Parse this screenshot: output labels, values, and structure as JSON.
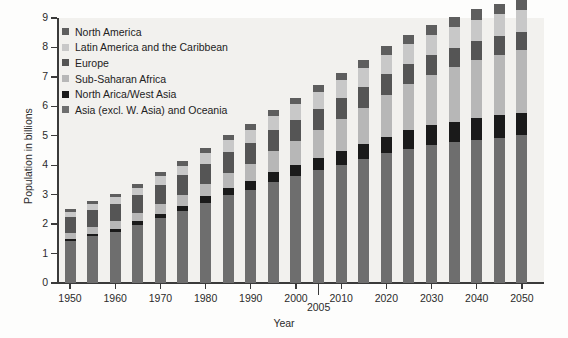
{
  "chart_data": {
    "type": "bar",
    "stacked": true,
    "title": "",
    "xlabel": "Year",
    "ylabel": "Population in billions",
    "ylim": [
      0,
      9
    ],
    "ytick_values": [
      0,
      1,
      2,
      3,
      4,
      5,
      6,
      7,
      8,
      9
    ],
    "ytick_labels": [
      "0",
      "1",
      "2",
      "3",
      "4",
      "5",
      "6",
      "7",
      "8",
      "9"
    ],
    "grid": false,
    "legend_position": "top-left inside plot",
    "categories": [
      "1950",
      "1955",
      "1960",
      "1965",
      "1970",
      "1975",
      "1980",
      "1985",
      "1990",
      "1995",
      "2000",
      "2005",
      "2010",
      "2015",
      "2020",
      "2025",
      "2030",
      "2035",
      "2040",
      "2045",
      "2050"
    ],
    "xtick_labels": [
      "1950",
      "1960",
      "1970",
      "1980",
      "1990",
      "2000",
      "2010",
      "2020",
      "2030",
      "2040",
      "2050"
    ],
    "annotation_tick_label": "2005",
    "series": [
      {
        "name": "Asia (excl. W. Asia) and Oceania",
        "color": "#6e6e6e",
        "values": [
          1.42,
          1.58,
          1.74,
          1.96,
          2.2,
          2.43,
          2.72,
          2.99,
          3.15,
          3.43,
          3.64,
          3.84,
          4.02,
          4.2,
          4.4,
          4.56,
          4.68,
          4.78,
          4.86,
          4.94,
          5.02
        ]
      },
      {
        "name": "North Arica/West Asia",
        "color": "#1a1a1a",
        "values": [
          0.09,
          0.1,
          0.11,
          0.13,
          0.16,
          0.19,
          0.22,
          0.25,
          0.3,
          0.34,
          0.38,
          0.42,
          0.47,
          0.52,
          0.57,
          0.62,
          0.67,
          0.7,
          0.73,
          0.75,
          0.77
        ]
      },
      {
        "name": "Sub-Saharan Africa",
        "color": "#b7b7b7",
        "values": [
          0.18,
          0.21,
          0.24,
          0.28,
          0.32,
          0.37,
          0.43,
          0.5,
          0.6,
          0.7,
          0.8,
          0.93,
          1.08,
          1.24,
          1.42,
          1.58,
          1.72,
          1.86,
          1.98,
          2.06,
          2.12
        ]
      },
      {
        "name": "Europe",
        "color": "#555555",
        "values": [
          0.55,
          0.58,
          0.6,
          0.62,
          0.65,
          0.67,
          0.68,
          0.7,
          0.72,
          0.73,
          0.73,
          0.73,
          0.72,
          0.71,
          0.7,
          0.68,
          0.67,
          0.65,
          0.64,
          0.63,
          0.62
        ]
      },
      {
        "name": "Latin America and the Caribbean",
        "color": "#c8c8c8",
        "values": [
          0.17,
          0.2,
          0.22,
          0.25,
          0.29,
          0.32,
          0.36,
          0.41,
          0.44,
          0.48,
          0.52,
          0.56,
          0.59,
          0.62,
          0.65,
          0.68,
          0.7,
          0.72,
          0.73,
          0.74,
          0.75
        ]
      },
      {
        "name": "North America",
        "color": "#5e5e5e",
        "values": [
          0.1,
          0.11,
          0.12,
          0.13,
          0.14,
          0.15,
          0.16,
          0.17,
          0.19,
          0.21,
          0.23,
          0.25,
          0.27,
          0.28,
          0.3,
          0.31,
          0.33,
          0.34,
          0.35,
          0.36,
          0.37
        ]
      }
    ],
    "totals": [
      2.51,
      2.78,
      3.03,
      3.37,
      3.76,
      4.13,
      4.57,
      5.02,
      5.4,
      5.89,
      6.3,
      6.73,
      7.15,
      7.57,
      8.04,
      8.43,
      8.77,
      9.05,
      9.29,
      9.48,
      9.65
    ]
  },
  "legend": {
    "items": [
      {
        "label": "North America",
        "color": "#5e5e5e"
      },
      {
        "label": "Latin America and the Caribbean",
        "color": "#c8c8c8"
      },
      {
        "label": "Europe",
        "color": "#555555"
      },
      {
        "label": "Sub-Saharan Africa",
        "color": "#b7b7b7"
      },
      {
        "label": "North Arica/West Asia",
        "color": "#1a1a1a"
      },
      {
        "label": "Asia (excl. W. Asia) and Oceania",
        "color": "#6e6e6e"
      }
    ]
  }
}
